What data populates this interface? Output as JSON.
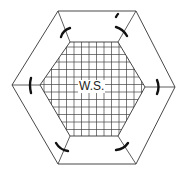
{
  "diagram": {
    "center_label": "W.S.",
    "stroke_color": "#333333",
    "background_color": "#ffffff",
    "outer_hexagon": [
      [
        58,
        11
      ],
      [
        136,
        11
      ],
      [
        175,
        87
      ],
      [
        136,
        164
      ],
      [
        58,
        164
      ],
      [
        12,
        85
      ]
    ],
    "inner_hexagon": [
      [
        70,
        42
      ],
      [
        118,
        42
      ],
      [
        145,
        87
      ],
      [
        118,
        136
      ],
      [
        70,
        136
      ],
      [
        40,
        85
      ]
    ],
    "grid_spacing": 7.5,
    "arc_marks": 6
  }
}
